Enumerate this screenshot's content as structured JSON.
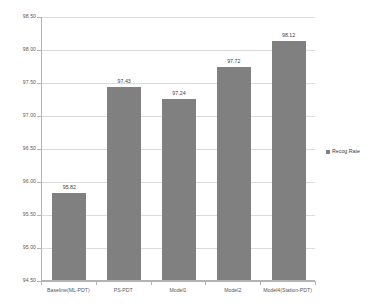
{
  "chart_data": {
    "type": "bar",
    "title": "",
    "subtitle": "",
    "xlabel": "",
    "ylabel": "",
    "categories": [
      "Baseline(ML-PDT)",
      "PS-PDT",
      "Model1",
      "Model2",
      "Model4(Station-PDT)"
    ],
    "series": [
      {
        "name": "Recog Rate",
        "values": [
          95.82,
          97.43,
          97.24,
          97.72,
          98.12
        ],
        "color": "#808080"
      }
    ],
    "values": [
      95.82,
      97.43,
      97.24,
      97.72,
      98.12
    ],
    "data_labels": [
      "95.82",
      "97.43",
      "97.24",
      "97.72",
      "98.12"
    ],
    "ylim": [
      94.5,
      98.5
    ],
    "ytick_values": [
      94.5,
      95.0,
      95.5,
      96.0,
      96.5,
      97.0,
      97.5,
      98.0,
      98.5
    ],
    "ytick_labels": [
      "94.50",
      "95.00",
      "95.50",
      "96.00",
      "96.50",
      "97.00",
      "97.50",
      "98.00",
      "98.50"
    ],
    "grid": true,
    "grid_axis": "y",
    "legend": {
      "position": "right",
      "entries": [
        "Recog Rate"
      ]
    }
  },
  "legend": {
    "label": "Recog Rate",
    "marker_color": "#808080"
  },
  "colors": {
    "bar": "#808080",
    "gridline": "#dcdcdc",
    "axis": "#b3b3b3",
    "text": "#595959",
    "background": "#ffffff"
  }
}
